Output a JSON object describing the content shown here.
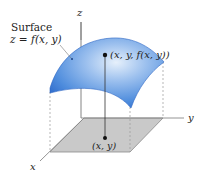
{
  "diagram": {
    "surface_label_line1": "Surface",
    "surface_label_line2": "z = f(x, y)",
    "point_label": "(x, y, f(x, y))",
    "base_point_label": "(x, y)",
    "axes": {
      "x": "x",
      "y": "y",
      "z": "z"
    },
    "colors": {
      "surface_light": "#cfe1f7",
      "surface_mid": "#6fa3e6",
      "surface_dark": "#2f6fd0",
      "base_plane": "#c8c8c8",
      "axis": "#777777"
    }
  }
}
